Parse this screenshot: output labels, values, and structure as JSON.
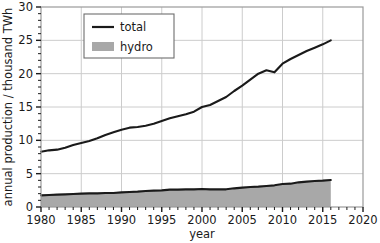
{
  "chart_data": {
    "type": "line",
    "title": "",
    "xlabel": "year",
    "ylabel": "annual production / thousand TWh",
    "xlim": [
      1980,
      2020
    ],
    "ylim": [
      0,
      30
    ],
    "xticks": [
      1980,
      1985,
      1990,
      1995,
      2000,
      2005,
      2010,
      2015,
      2020
    ],
    "yticks": [
      0,
      5,
      10,
      15,
      20,
      25,
      30
    ],
    "xtick_labels": [
      "1980",
      "1985",
      "1990",
      "1995",
      "2000",
      "2005",
      "2010",
      "2015",
      "2020"
    ],
    "ytick_labels": [
      "0",
      "5",
      "10",
      "15",
      "20",
      "25",
      "30"
    ],
    "xminor_step": 1,
    "yminor_step": 1,
    "grid": true,
    "legend_position": "top-left-inside",
    "series": [
      {
        "name": "total",
        "label": "total",
        "style": "line",
        "color": "#1a1a1a",
        "x": [
          1980,
          1981,
          1982,
          1983,
          1984,
          1985,
          1986,
          1987,
          1988,
          1989,
          1990,
          1991,
          1992,
          1993,
          1994,
          1995,
          1996,
          1997,
          1998,
          1999,
          2000,
          2001,
          2002,
          2003,
          2004,
          2005,
          2006,
          2007,
          2008,
          2009,
          2010,
          2011,
          2012,
          2013,
          2014,
          2015,
          2016
        ],
        "values": [
          8.3,
          8.5,
          8.6,
          8.9,
          9.3,
          9.6,
          9.9,
          10.3,
          10.8,
          11.2,
          11.6,
          11.9,
          12.0,
          12.2,
          12.5,
          12.9,
          13.3,
          13.6,
          13.9,
          14.3,
          15.0,
          15.3,
          15.9,
          16.5,
          17.4,
          18.2,
          19.1,
          20.0,
          20.5,
          20.2,
          21.5,
          22.2,
          22.8,
          23.4,
          23.9,
          24.4,
          25.0
        ]
      },
      {
        "name": "hydro",
        "label": "hydro",
        "style": "filled-area",
        "color": "#a8a8a8",
        "edge_color": "#1a1a1a",
        "x": [
          1980,
          1981,
          1982,
          1983,
          1984,
          1985,
          1986,
          1987,
          1988,
          1989,
          1990,
          1991,
          1992,
          1993,
          1994,
          1995,
          1996,
          1997,
          1998,
          1999,
          2000,
          2001,
          2002,
          2003,
          2004,
          2005,
          2006,
          2007,
          2008,
          2009,
          2010,
          2011,
          2012,
          2013,
          2014,
          2015,
          2016
        ],
        "values": [
          1.75,
          1.8,
          1.85,
          1.9,
          1.95,
          2.0,
          2.05,
          2.05,
          2.1,
          2.1,
          2.2,
          2.25,
          2.3,
          2.4,
          2.45,
          2.5,
          2.6,
          2.6,
          2.65,
          2.65,
          2.7,
          2.65,
          2.65,
          2.65,
          2.8,
          2.9,
          3.0,
          3.05,
          3.15,
          3.25,
          3.45,
          3.5,
          3.7,
          3.8,
          3.9,
          3.95,
          4.05
        ]
      }
    ]
  },
  "legend": {
    "entries": [
      {
        "label": "total",
        "marker": "line",
        "color": "#1a1a1a"
      },
      {
        "label": "hydro",
        "marker": "swatch",
        "color": "#a8a8a8"
      }
    ]
  },
  "axes": {
    "x_title": "year",
    "y_title": "annual production / thousand TWh"
  },
  "colors": {
    "line": "#1a1a1a",
    "area_fill": "#a8a8a8",
    "grid": "#cccccc",
    "frame": "#9a9a9a",
    "background": "#ffffff"
  }
}
